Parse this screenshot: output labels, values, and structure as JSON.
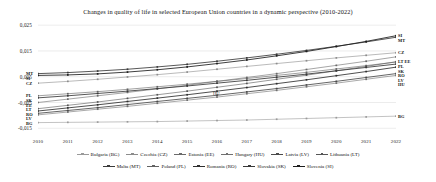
{
  "chart_data": {
    "type": "line",
    "title": "Changes in quality of life in selected European Union countries in a dynamic perspective (2010-2022)",
    "xlabel": "",
    "ylabel": "",
    "x": [
      2010,
      2011,
      2012,
      2013,
      2014,
      2015,
      2016,
      2017,
      2018,
      2019,
      2020,
      2021,
      2022
    ],
    "xtick_labels": [
      "2010",
      "2011",
      "2012",
      "2013",
      "2014",
      "2015",
      "2016",
      "2017",
      "2018",
      "2019",
      "2020",
      "2021",
      "2022"
    ],
    "ytick_labels": [
      "0,025",
      "0,015",
      "0,005",
      "-0,005",
      "-0,015"
    ],
    "ytick_values": [
      0.025,
      0.015,
      0.005,
      -0.005,
      -0.015
    ],
    "ylim": [
      -0.018,
      0.027
    ],
    "grid": true,
    "legend_position": "bottom",
    "series": [
      {
        "name": "Bulgaria (BG)",
        "code": "BG",
        "color": "#9a9a9a",
        "values": [
          -0.0128,
          -0.0127,
          -0.0126,
          -0.0125,
          -0.0124,
          -0.0122,
          -0.012,
          -0.0118,
          -0.0115,
          -0.0112,
          -0.0109,
          -0.0106,
          -0.0103
        ]
      },
      {
        "name": "Czechia (CZ)",
        "code": "CZ",
        "color": "#8c8c8c",
        "values": [
          0.0025,
          0.0032,
          0.004,
          0.0049,
          0.0058,
          0.0068,
          0.0079,
          0.009,
          0.0101,
          0.0112,
          0.0123,
          0.0133,
          0.0143
        ]
      },
      {
        "name": "Estonia (EE)",
        "code": "EE",
        "color": "#6a6a6a",
        "values": [
          -0.005,
          -0.0037,
          -0.0024,
          -0.0011,
          0.0003,
          0.0017,
          0.0032,
          0.0047,
          0.0062,
          0.0078,
          0.0094,
          0.011,
          0.0127
        ]
      },
      {
        "name": "Hungary (HU)",
        "code": "HU",
        "color": "#707070",
        "values": [
          -0.0098,
          -0.0087,
          -0.0076,
          -0.0065,
          -0.0053,
          -0.0041,
          -0.0029,
          -0.0016,
          -0.0003,
          0.0011,
          0.0025,
          0.004,
          0.0055
        ]
      },
      {
        "name": "Latvia (LV)",
        "code": "LV",
        "color": "#4a4a4a",
        "values": [
          -0.0092,
          -0.0081,
          -0.007,
          -0.0058,
          -0.0046,
          -0.0034,
          -0.0022,
          -0.0009,
          0.0004,
          0.0018,
          0.0032,
          0.0047,
          0.0062
        ]
      },
      {
        "name": "Lithuania (LT)",
        "code": "LT",
        "color": "#555555",
        "values": [
          -0.0074,
          -0.0061,
          -0.0048,
          -0.0034,
          -0.002,
          -0.0006,
          0.0009,
          0.0024,
          0.004,
          0.0056,
          0.0073,
          0.009,
          0.0108
        ]
      },
      {
        "name": "Malta (MT)",
        "code": "MT",
        "color": "#3a3a3a",
        "values": [
          0.0062,
          0.0066,
          0.0072,
          0.0079,
          0.0088,
          0.0098,
          0.011,
          0.0123,
          0.0137,
          0.0152,
          0.0168,
          0.0185,
          0.0203
        ]
      },
      {
        "name": "Poland (PL)",
        "code": "PL",
        "color": "#626262",
        "values": [
          -0.0024,
          -0.0016,
          -0.0008,
          0.0001,
          0.0011,
          0.0021,
          0.0032,
          0.0043,
          0.0055,
          0.0067,
          0.008,
          0.0093,
          0.0107
        ]
      },
      {
        "name": "Romania (RO)",
        "code": "RO",
        "color": "#2e2e2e",
        "values": [
          -0.0083,
          -0.0071,
          -0.0059,
          -0.0046,
          -0.0033,
          -0.002,
          -0.0006,
          0.0008,
          0.0023,
          0.0038,
          0.0054,
          0.007,
          0.0087
        ]
      },
      {
        "name": "Slovakia (SK)",
        "code": "SK",
        "color": "#383838",
        "values": [
          -0.0032,
          -0.0024,
          -0.0015,
          -0.0006,
          0.0004,
          0.0014,
          0.0025,
          0.0036,
          0.0048,
          0.006,
          0.0073,
          0.0086,
          0.0099
        ]
      },
      {
        "name": "Slovenia (SI)",
        "code": "SI",
        "color": "#1c1c1c",
        "values": [
          0.0055,
          0.0057,
          0.0061,
          0.0068,
          0.0077,
          0.0088,
          0.0101,
          0.0115,
          0.0131,
          0.0148,
          0.0167,
          0.0187,
          0.0209
        ]
      }
    ],
    "left_edge_labels": [
      "MT",
      "SI",
      "CZ",
      "PL",
      "SK",
      "EE",
      "LT",
      "RO",
      "LV",
      "BG"
    ],
    "right_edge_labels": [
      "SI",
      "MT",
      "CZ",
      "LT EE",
      "PL",
      "SK",
      "RO",
      "LV",
      "HU",
      "BG"
    ],
    "inner_labels": [
      "HU"
    ]
  }
}
